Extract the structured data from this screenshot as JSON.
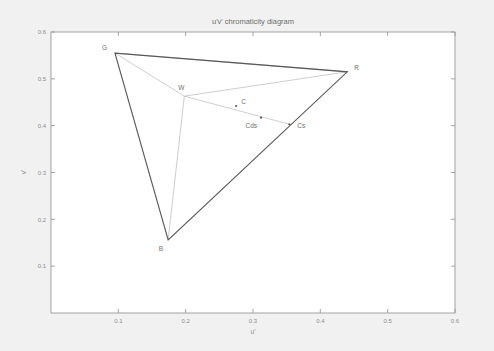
{
  "figure": {
    "title": "u'v' chromaticity diagram",
    "background_color": "#f1f1f1",
    "plot_background_color": "#ffffff",
    "axis_color": "#9a9a9a",
    "gamut_color": "#5a5a5a",
    "inner_line_color": "#b4b4b4"
  },
  "chart_data": {
    "type": "scatter",
    "title": "u'v' chromaticity diagram",
    "xlabel": "u'",
    "ylabel": "v'",
    "xlim": [
      0.0,
      0.6
    ],
    "ylim": [
      0.0,
      0.6
    ],
    "xticks": [
      "0.1",
      "0.2",
      "0.3",
      "0.4",
      "0.5",
      "0.6"
    ],
    "xtick_values": [
      0.1,
      0.2,
      0.3,
      0.4,
      0.5,
      0.6
    ],
    "yticks": [
      "0.1",
      "0.2",
      "0.3",
      "0.4",
      "0.5",
      "0.6"
    ],
    "ytick_values": [
      0.1,
      0.2,
      0.3,
      0.4,
      0.5,
      0.6
    ],
    "grid": false,
    "legend": false,
    "points": [
      {
        "name": "G",
        "label": "G",
        "u": 0.095,
        "v": 0.555,
        "label_dx": -8,
        "label_dy": -3
      },
      {
        "name": "R",
        "label": "R",
        "u": 0.44,
        "v": 0.515,
        "label_dx": 7,
        "label_dy": -2
      },
      {
        "name": "B",
        "label": "B",
        "u": 0.174,
        "v": 0.156,
        "label_dx": -5,
        "label_dy": 11
      },
      {
        "name": "W",
        "label": "W",
        "u": 0.198,
        "v": 0.463,
        "label_dx": -3,
        "label_dy": -6
      },
      {
        "name": "C",
        "label": "C",
        "u": 0.275,
        "v": 0.442,
        "label_dx": 5,
        "label_dy": -2
      },
      {
        "name": "Cds",
        "label": "Cds",
        "u": 0.312,
        "v": 0.417,
        "label_dx": -4,
        "label_dy": 10
      },
      {
        "name": "Cs",
        "label": "Cs",
        "u": 0.354,
        "v": 0.403,
        "label_dx": 8,
        "label_dy": 4
      }
    ],
    "gamut_triangle": [
      "G",
      "R",
      "B"
    ],
    "inner_lines": [
      {
        "from": "W",
        "to": "G"
      },
      {
        "from": "W",
        "to": "R"
      },
      {
        "from": "W",
        "to": "B"
      },
      {
        "from": "W",
        "to": "Cs"
      },
      {
        "from": "G",
        "to": "R"
      }
    ]
  }
}
